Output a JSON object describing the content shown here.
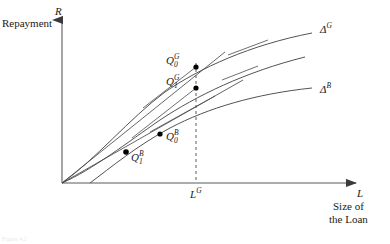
{
  "figure": {
    "type": "economics-line-diagram",
    "background": "#ffffff",
    "ink_color": "#333333",
    "accent_color": "#000000"
  },
  "axes": {
    "y": {
      "symbol": "R",
      "description": "Repayment",
      "arrow": "up",
      "origin_px": [
        62,
        183
      ],
      "top_px": [
        62,
        14
      ]
    },
    "x": {
      "symbol": "L",
      "description_line1": "Size of",
      "description_line2": "the Loan",
      "arrow": "right",
      "origin_px": [
        62,
        183
      ],
      "end_px": [
        362,
        183
      ]
    }
  },
  "markers": {
    "vertical_dashed": {
      "label": "L",
      "label_sup": "G",
      "x_px": 196,
      "y_top_px": 63,
      "y_bottom_px": 183,
      "style": "dashed"
    }
  },
  "curves": [
    {
      "name": "delta-G-curve",
      "label": "Δ",
      "label_sup": "G",
      "label_px": [
        320,
        28
      ],
      "path": "M 62 183 C 95 160, 130 118, 165 92 C 200 68, 250 45, 312 33",
      "note": "upper concave curve, good type"
    },
    {
      "name": "middle-curve",
      "label": "",
      "label_sup": "",
      "label_px": [
        0,
        0
      ],
      "path": "M 62 183 C 92 170, 128 142, 160 120 C 196 96, 245 72, 305 57",
      "note": "unlabeled middle concave curve"
    },
    {
      "name": "delta-B-curve",
      "label": "Δ",
      "label_sup": "B",
      "label_px": [
        320,
        88
      ],
      "path": "M 90 183 C 110 168, 138 145, 170 128 C 208 108, 255 94, 312 88",
      "note": "lower concave curve, bad type"
    }
  ],
  "rays": [
    {
      "name": "ray-through-Q1B-Q0G",
      "from_px": [
        62,
        183
      ],
      "to_px": [
        225,
        52
      ]
    },
    {
      "name": "ray-through-Q1B-Q1G",
      "from_px": [
        62,
        183
      ],
      "to_px": [
        243,
        80
      ]
    }
  ],
  "tangents": [
    {
      "name": "tangent-at-Q0G",
      "from_px": [
        143,
        108
      ],
      "to_px": [
        196,
        67
      ]
    },
    {
      "name": "tangent-upper-right",
      "from_px": [
        228,
        55
      ],
      "to_px": [
        268,
        40
      ]
    },
    {
      "name": "tangent-at-Q1G",
      "from_px": [
        132,
        138
      ],
      "to_px": [
        196,
        88
      ]
    },
    {
      "name": "tangent-mid-right",
      "from_px": [
        222,
        80
      ],
      "to_px": [
        258,
        66
      ]
    },
    {
      "name": "tangent-at-Q0B",
      "from_px": [
        150,
        132
      ],
      "to_px": [
        215,
        96
      ]
    }
  ],
  "points": [
    {
      "name": "point-Q0G",
      "base": "Q",
      "sub": "0",
      "sup": "G",
      "px": [
        196,
        67
      ],
      "label_px": [
        163,
        55
      ],
      "label_anchor": "right"
    },
    {
      "name": "point-Q1G",
      "base": "Q",
      "sub": "1",
      "sup": "G",
      "px": [
        196,
        88
      ],
      "label_px": [
        163,
        76
      ],
      "label_anchor": "right"
    },
    {
      "name": "point-Q0B",
      "base": "Q",
      "sub": "0",
      "sup": "B",
      "px": [
        160,
        134
      ],
      "label_px": [
        166,
        133
      ],
      "label_anchor": "left"
    },
    {
      "name": "point-Q1B",
      "base": "Q",
      "sub": "1",
      "sup": "B",
      "px": [
        126,
        152
      ],
      "label_px": [
        130,
        153
      ],
      "label_anchor": "left"
    }
  ],
  "caption": {
    "text": "Figure 4.2"
  }
}
